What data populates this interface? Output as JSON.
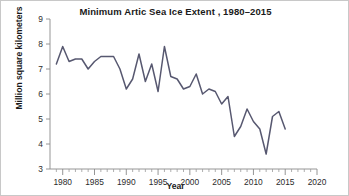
{
  "chart_data": {
    "type": "line",
    "title": "Minimum Artic Sea Ice Extent , 1980–2015",
    "xlabel": "Year",
    "ylabel": "Million square kilometers",
    "xlim": [
      1978,
      2020
    ],
    "ylim": [
      3,
      9
    ],
    "xticks": [
      1980,
      1985,
      1990,
      1995,
      2000,
      2005,
      2010,
      2015,
      2020
    ],
    "xtick_labels": [
      "1980",
      "1985",
      "1990",
      "1995",
      "2000",
      "2005",
      "2010",
      "2015",
      "2020"
    ],
    "yticks": [
      3,
      4,
      5,
      6,
      7,
      8,
      9
    ],
    "ytick_labels": [
      "3",
      "4",
      "5",
      "6",
      "7",
      "8",
      "9"
    ],
    "minor_xtick_interval": 1,
    "grid": false,
    "legend": null,
    "line_color": "#575870",
    "series": [
      {
        "name": "Minimum Arctic sea ice extent",
        "x": [
          1979,
          1980,
          1981,
          1982,
          1983,
          1984,
          1985,
          1986,
          1987,
          1988,
          1989,
          1990,
          1991,
          1992,
          1993,
          1994,
          1995,
          1996,
          1997,
          1998,
          1999,
          2000,
          2001,
          2002,
          2003,
          2004,
          2005,
          2006,
          2007,
          2008,
          2009,
          2010,
          2011,
          2012,
          2013,
          2014,
          2015
        ],
        "values": [
          7.2,
          7.9,
          7.3,
          7.4,
          7.4,
          7.0,
          7.3,
          7.5,
          7.5,
          7.5,
          7.0,
          6.2,
          6.6,
          7.6,
          6.5,
          7.2,
          6.1,
          7.9,
          6.7,
          6.6,
          6.2,
          6.3,
          6.8,
          6.0,
          6.2,
          6.1,
          5.6,
          5.9,
          4.3,
          4.7,
          5.4,
          4.9,
          4.6,
          3.6,
          5.1,
          5.3,
          4.6
        ]
      }
    ]
  }
}
